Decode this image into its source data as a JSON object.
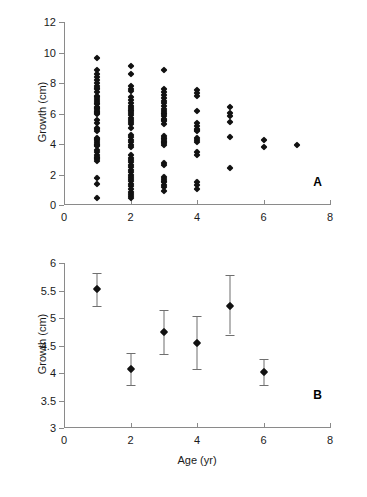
{
  "figure": {
    "background": "#ffffff",
    "marker_color": "#111111",
    "axis_color": "#8a8a8a",
    "errorbar_color": "#6f6f6f"
  },
  "chart_data": [
    {
      "type": "scatter",
      "panel": "A",
      "panel_label": "A",
      "title": "",
      "xlabel": "",
      "ylabel": "Growth (cm)",
      "xlim": [
        0,
        8
      ],
      "ylim": [
        0,
        12
      ],
      "xticks": [
        0,
        2,
        4,
        6,
        8
      ],
      "xtick_labels": [
        "0",
        "2",
        "4",
        "6",
        "8"
      ],
      "yticks": [
        0,
        2,
        4,
        6,
        8,
        10,
        12
      ],
      "ytick_labels": [
        "0",
        "2",
        "4",
        "6",
        "8",
        "10",
        "12"
      ],
      "grid": false,
      "legend": false,
      "marker": "diamond",
      "description": "Strip plot of individual growth measurements at each integer age; point density decreases with age.",
      "group_counts": {
        "1": 45,
        "2": 44,
        "3": 33,
        "4": 17,
        "5": 6,
        "6": 2,
        "7": 1
      },
      "points": [
        {
          "x": 1,
          "y": 9.65
        },
        {
          "x": 1,
          "y": 8.85
        },
        {
          "x": 1,
          "y": 8.62
        },
        {
          "x": 1,
          "y": 8.42
        },
        {
          "x": 1,
          "y": 8.2
        },
        {
          "x": 1,
          "y": 8.0
        },
        {
          "x": 1,
          "y": 7.78
        },
        {
          "x": 1,
          "y": 7.58
        },
        {
          "x": 1,
          "y": 7.38
        },
        {
          "x": 1,
          "y": 7.18
        },
        {
          "x": 1,
          "y": 6.98
        },
        {
          "x": 1,
          "y": 6.8
        },
        {
          "x": 1,
          "y": 6.62
        },
        {
          "x": 1,
          "y": 6.45
        },
        {
          "x": 1,
          "y": 6.3
        },
        {
          "x": 1,
          "y": 6.18
        },
        {
          "x": 1,
          "y": 6.05
        },
        {
          "x": 1,
          "y": 5.95
        },
        {
          "x": 1,
          "y": 5.55
        },
        {
          "x": 1,
          "y": 5.35
        },
        {
          "x": 1,
          "y": 5.0
        },
        {
          "x": 1,
          "y": 4.85
        },
        {
          "x": 1,
          "y": 4.4
        },
        {
          "x": 1,
          "y": 4.25
        },
        {
          "x": 1,
          "y": 4.12
        },
        {
          "x": 1,
          "y": 4.0
        },
        {
          "x": 1,
          "y": 3.88
        },
        {
          "x": 1,
          "y": 3.62
        },
        {
          "x": 1,
          "y": 3.45
        },
        {
          "x": 1,
          "y": 3.3
        },
        {
          "x": 1,
          "y": 3.15
        },
        {
          "x": 1,
          "y": 3.02
        },
        {
          "x": 1,
          "y": 2.9
        },
        {
          "x": 1,
          "y": 1.8
        },
        {
          "x": 1,
          "y": 1.35
        },
        {
          "x": 1,
          "y": 0.45
        },
        {
          "x": 1,
          "y": 7.68
        },
        {
          "x": 1,
          "y": 7.08
        },
        {
          "x": 1,
          "y": 6.72
        },
        {
          "x": 1,
          "y": 6.38
        },
        {
          "x": 1,
          "y": 6.12
        },
        {
          "x": 1,
          "y": 5.05
        },
        {
          "x": 1,
          "y": 4.32
        },
        {
          "x": 1,
          "y": 3.95
        },
        {
          "x": 1,
          "y": 3.08
        },
        {
          "x": 2,
          "y": 9.12
        },
        {
          "x": 2,
          "y": 8.58
        },
        {
          "x": 2,
          "y": 7.78
        },
        {
          "x": 2,
          "y": 7.62
        },
        {
          "x": 2,
          "y": 7.45
        },
        {
          "x": 2,
          "y": 7.05
        },
        {
          "x": 2,
          "y": 6.88
        },
        {
          "x": 2,
          "y": 6.7
        },
        {
          "x": 2,
          "y": 6.52
        },
        {
          "x": 2,
          "y": 6.35
        },
        {
          "x": 2,
          "y": 6.18
        },
        {
          "x": 2,
          "y": 6.02
        },
        {
          "x": 2,
          "y": 5.88
        },
        {
          "x": 2,
          "y": 5.72
        },
        {
          "x": 2,
          "y": 5.58
        },
        {
          "x": 2,
          "y": 5.42
        },
        {
          "x": 2,
          "y": 5.28
        },
        {
          "x": 2,
          "y": 5.08
        },
        {
          "x": 2,
          "y": 4.62
        },
        {
          "x": 2,
          "y": 4.45
        },
        {
          "x": 2,
          "y": 4.28
        },
        {
          "x": 2,
          "y": 4.12
        },
        {
          "x": 2,
          "y": 3.95
        },
        {
          "x": 2,
          "y": 3.8
        },
        {
          "x": 2,
          "y": 3.25
        },
        {
          "x": 2,
          "y": 3.1
        },
        {
          "x": 2,
          "y": 2.95
        },
        {
          "x": 2,
          "y": 2.8
        },
        {
          "x": 2,
          "y": 2.62
        },
        {
          "x": 2,
          "y": 2.48
        },
        {
          "x": 2,
          "y": 2.32
        },
        {
          "x": 2,
          "y": 2.15
        },
        {
          "x": 2,
          "y": 2.0
        },
        {
          "x": 2,
          "y": 1.85
        },
        {
          "x": 2,
          "y": 1.7
        },
        {
          "x": 2,
          "y": 1.55
        },
        {
          "x": 2,
          "y": 1.4
        },
        {
          "x": 2,
          "y": 1.22
        },
        {
          "x": 2,
          "y": 1.05
        },
        {
          "x": 2,
          "y": 0.88
        },
        {
          "x": 2,
          "y": 0.72
        },
        {
          "x": 2,
          "y": 0.58
        },
        {
          "x": 2,
          "y": 0.45
        },
        {
          "x": 2,
          "y": 6.25
        },
        {
          "x": 3,
          "y": 8.88
        },
        {
          "x": 3,
          "y": 7.62
        },
        {
          "x": 3,
          "y": 7.42
        },
        {
          "x": 3,
          "y": 7.22
        },
        {
          "x": 3,
          "y": 7.02
        },
        {
          "x": 3,
          "y": 6.85
        },
        {
          "x": 3,
          "y": 6.68
        },
        {
          "x": 3,
          "y": 6.5
        },
        {
          "x": 3,
          "y": 6.32
        },
        {
          "x": 3,
          "y": 6.15
        },
        {
          "x": 3,
          "y": 5.98
        },
        {
          "x": 3,
          "y": 5.82
        },
        {
          "x": 3,
          "y": 5.65
        },
        {
          "x": 3,
          "y": 5.48
        },
        {
          "x": 3,
          "y": 5.32
        },
        {
          "x": 3,
          "y": 4.52
        },
        {
          "x": 3,
          "y": 4.38
        },
        {
          "x": 3,
          "y": 4.22
        },
        {
          "x": 3,
          "y": 4.08
        },
        {
          "x": 3,
          "y": 3.92
        },
        {
          "x": 3,
          "y": 2.78
        },
        {
          "x": 3,
          "y": 2.62
        },
        {
          "x": 3,
          "y": 1.85
        },
        {
          "x": 3,
          "y": 1.68
        },
        {
          "x": 3,
          "y": 1.48
        },
        {
          "x": 3,
          "y": 1.32
        },
        {
          "x": 3,
          "y": 1.15
        },
        {
          "x": 3,
          "y": 0.95
        },
        {
          "x": 3,
          "y": 6.05
        },
        {
          "x": 3,
          "y": 5.55
        },
        {
          "x": 3,
          "y": 4.3
        },
        {
          "x": 3,
          "y": 4.15
        },
        {
          "x": 3,
          "y": 1.58
        },
        {
          "x": 4,
          "y": 7.52
        },
        {
          "x": 4,
          "y": 7.35
        },
        {
          "x": 4,
          "y": 7.18
        },
        {
          "x": 4,
          "y": 6.18
        },
        {
          "x": 4,
          "y": 5.35
        },
        {
          "x": 4,
          "y": 5.15
        },
        {
          "x": 4,
          "y": 5.0
        },
        {
          "x": 4,
          "y": 4.85
        },
        {
          "x": 4,
          "y": 4.42
        },
        {
          "x": 4,
          "y": 4.25
        },
        {
          "x": 4,
          "y": 4.1
        },
        {
          "x": 4,
          "y": 3.45
        },
        {
          "x": 4,
          "y": 3.3
        },
        {
          "x": 4,
          "y": 1.52
        },
        {
          "x": 4,
          "y": 1.32
        },
        {
          "x": 4,
          "y": 1.08
        },
        {
          "x": 4,
          "y": 4.95
        },
        {
          "x": 5,
          "y": 6.45
        },
        {
          "x": 5,
          "y": 6.05
        },
        {
          "x": 5,
          "y": 5.85
        },
        {
          "x": 5,
          "y": 5.45
        },
        {
          "x": 5,
          "y": 4.45
        },
        {
          "x": 5,
          "y": 2.42
        },
        {
          "x": 6,
          "y": 4.25
        },
        {
          "x": 6,
          "y": 3.82
        },
        {
          "x": 7,
          "y": 3.92
        }
      ]
    },
    {
      "type": "scatter",
      "panel": "B",
      "panel_label": "B",
      "title": "",
      "xlabel": "Age (yr)",
      "ylabel": "Growth (cm)",
      "xlim": [
        0,
        8
      ],
      "ylim": [
        3,
        6
      ],
      "xticks": [
        0,
        2,
        4,
        6,
        8
      ],
      "xtick_labels": [
        "0",
        "2",
        "4",
        "6",
        "8"
      ],
      "yticks": [
        3,
        3.5,
        4,
        4.5,
        5,
        5.5,
        6
      ],
      "ytick_labels": [
        "3",
        "3.5",
        "4",
        "4.5",
        "5",
        "5.5",
        "6"
      ],
      "grid": false,
      "legend": false,
      "marker": "diamond",
      "errorbars": true,
      "description": "Mean growth with error bars at each age from 1 to 6 years.",
      "categories": [
        1,
        2,
        3,
        4,
        5,
        6
      ],
      "values": [
        5.52,
        4.07,
        4.74,
        4.54,
        5.22,
        4.01
      ],
      "error_low": [
        5.22,
        3.78,
        4.35,
        4.07,
        4.7,
        3.79
      ],
      "error_high": [
        5.82,
        4.37,
        5.15,
        5.03,
        5.78,
        4.25
      ],
      "points": [
        {
          "x": 1,
          "y": 5.52,
          "low": 5.22,
          "high": 5.82
        },
        {
          "x": 2,
          "y": 4.07,
          "low": 3.78,
          "high": 4.37
        },
        {
          "x": 3,
          "y": 4.74,
          "low": 4.35,
          "high": 5.15
        },
        {
          "x": 4,
          "y": 4.54,
          "low": 4.07,
          "high": 5.03
        },
        {
          "x": 5,
          "y": 5.22,
          "low": 4.7,
          "high": 5.78
        },
        {
          "x": 6,
          "y": 4.01,
          "low": 3.79,
          "high": 4.25
        }
      ]
    }
  ]
}
